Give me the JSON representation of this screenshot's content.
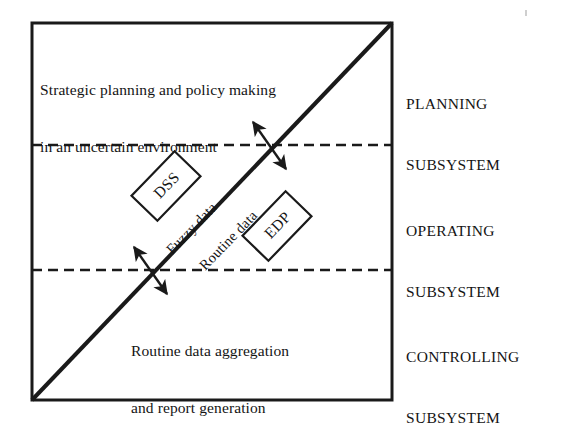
{
  "diagram": {
    "frame": {
      "x": 32,
      "y": 23,
      "width": 360,
      "height": 377,
      "border_color": "#1a1a1a",
      "border_width": 3
    },
    "background_color": "#ffffff",
    "line_color": "#1a1a1a",
    "divider_style": "dashed",
    "dividers": [
      {
        "name": "planning-operating-divider",
        "y": 145
      },
      {
        "name": "operating-controlling-divider",
        "y": 270
      }
    ],
    "diagonal": {
      "name": "data-continuum-diagonal",
      "x1": 32,
      "y1": 400,
      "x2": 392,
      "y2": 23,
      "width": 4
    },
    "regions": [
      {
        "id": "planning",
        "caption_lines": [
          "Strategic planning and policy making",
          "in an uncertain environment"
        ],
        "caption_x": 40,
        "caption_y": 44,
        "subsystem_label_lines": [
          "PLANNING",
          "SUBSYSTEM"
        ],
        "label_x": 405,
        "label_y": 55
      },
      {
        "id": "operating",
        "caption_lines": [],
        "caption_x": 0,
        "caption_y": 0,
        "subsystem_label_lines": [
          "OPERATING",
          "SUBSYSTEM"
        ],
        "label_x": 405,
        "label_y": 182
      },
      {
        "id": "controlling",
        "caption_lines": [
          "Routine data aggregation",
          "and report generation"
        ],
        "caption_x": 131,
        "caption_y": 305,
        "subsystem_label_lines": [
          "CONTROLLING",
          "SUBSYSTEM"
        ],
        "label_x": 405,
        "label_y": 308
      }
    ],
    "flow_labels": [
      {
        "id": "fuzzy-data",
        "text": "Fuzzy data",
        "x": 163,
        "y": 246,
        "rotation_deg": -46
      },
      {
        "id": "routine-data",
        "text": "Routine data",
        "x": 196,
        "y": 262,
        "rotation_deg": -46
      }
    ],
    "boxes": [
      {
        "id": "dss-box",
        "label": "DSS",
        "cx": 166,
        "cy": 186,
        "width": 62,
        "height": 36,
        "rotation_deg": -46
      },
      {
        "id": "edp-box",
        "label": "EDP",
        "cx": 277,
        "cy": 226,
        "width": 62,
        "height": 36,
        "rotation_deg": -46
      }
    ],
    "crossing_arrows": [
      {
        "id": "upper-crossing-arrow",
        "cx": 269,
        "cy": 145,
        "length": 46,
        "rotation_deg": 46,
        "double_headed": true
      },
      {
        "id": "lower-crossing-arrow",
        "cx": 150,
        "cy": 270,
        "length": 46,
        "rotation_deg": 46,
        "double_headed": true
      }
    ]
  }
}
